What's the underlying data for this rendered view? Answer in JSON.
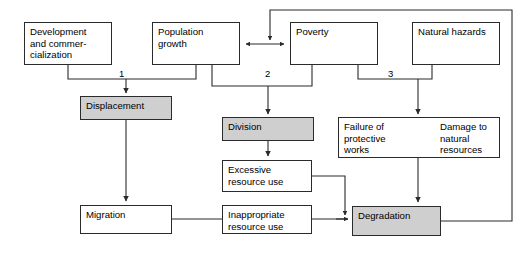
{
  "diagram": {
    "type": "flowchart",
    "nodes": {
      "development": {
        "label": "Development\nand commer-\ncialization",
        "fill": "#ffffff"
      },
      "population": {
        "label": "Population\ngrowth",
        "fill": "#ffffff"
      },
      "poverty": {
        "label": "Poverty",
        "fill": "#ffffff"
      },
      "hazards": {
        "label": "Natural hazards",
        "fill": "#ffffff"
      },
      "displacement": {
        "label": "Displacement",
        "fill": "#cfcfcf"
      },
      "division": {
        "label": "Division",
        "fill": "#cfcfcf"
      },
      "failure": {
        "label": "Failure of\nprotective\nworks",
        "fill": "#ffffff"
      },
      "damage": {
        "label": "Damage to\nnatural\nresources",
        "fill": "#ffffff"
      },
      "excessive": {
        "label": "Excessive\nresource use",
        "fill": "#ffffff"
      },
      "inappropriate": {
        "label": "Inappropriate\nresource use",
        "fill": "#ffffff"
      },
      "migration": {
        "label": "Migration",
        "fill": "#ffffff"
      },
      "degradation": {
        "label": "Degradation",
        "fill": "#cfcfcf"
      }
    },
    "branch_labels": {
      "one": "1",
      "two": "2",
      "three": "3"
    },
    "colors": {
      "stroke": "#2b2b2b",
      "shaded_fill": "#cfcfcf",
      "plain_fill": "#ffffff",
      "text": "#000000"
    }
  }
}
